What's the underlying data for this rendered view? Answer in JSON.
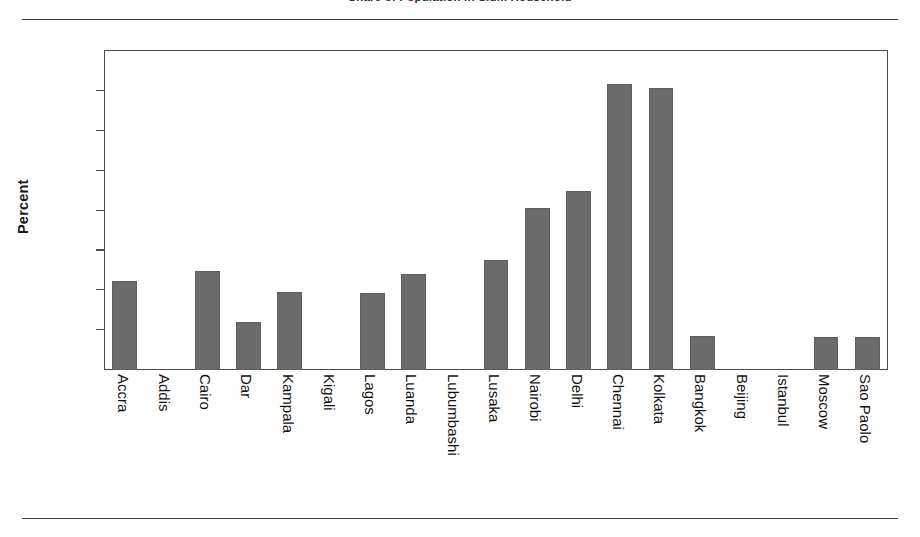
{
  "figure": {
    "title_fragment": "Share of Population in Slum Household",
    "rules": {
      "top": true,
      "bottom": true
    }
  },
  "colors": {
    "bar_fill": "#6b6b6b",
    "bar_stroke": "#5e5e5e",
    "axis": "#4a4a4a",
    "text": "#111111",
    "rule": "#3a3a3a",
    "background": "#ffffff"
  },
  "chart_data": {
    "type": "bar",
    "title": "Share of Population in Slum Household",
    "xlabel": "",
    "ylabel": "Percent",
    "ylim": [
      0,
      80
    ],
    "yticks": [
      0,
      10,
      20,
      30,
      40,
      50,
      60,
      70,
      80
    ],
    "grid": false,
    "legend": "none",
    "categories": [
      "Accra",
      "Addis",
      "Cairo",
      "Dar",
      "Kampala",
      "Kigali",
      "Lagos",
      "Luanda",
      "Lubumbashi",
      "Lusaka",
      "Nairobi",
      "Delhi",
      "Chennai",
      "Kolkata",
      "Bangkok",
      "Beijing",
      "Istanbul",
      "Moscow",
      "Sao Paolo"
    ],
    "values": [
      22.2,
      0,
      24.8,
      12.1,
      19.6,
      0,
      19.3,
      24.2,
      0,
      27.6,
      40.7,
      45.0,
      71.8,
      70.7,
      8.6,
      0,
      0,
      8.4,
      8.2
    ],
    "groups": [
      {
        "name": "Africa",
        "start": 0,
        "end": 10
      },
      {
        "name": "South Asia",
        "start": 11,
        "end": 13
      },
      {
        "name": "Other",
        "start": 14,
        "end": 18
      }
    ]
  }
}
